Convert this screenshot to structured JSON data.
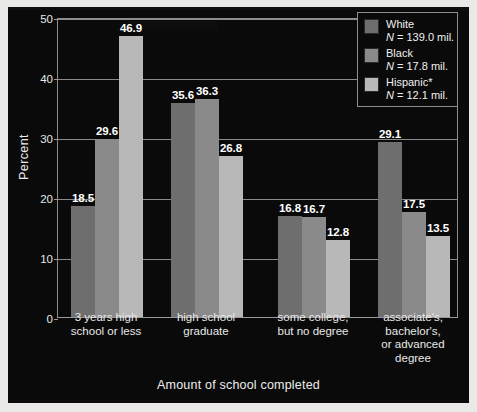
{
  "figure": {
    "background_color": "#0a0a0a",
    "page_color": "#e9e9e7"
  },
  "axis": {
    "ylabel": "Percent",
    "xlabel": "Amount of school completed",
    "yticks": [
      "0",
      "10",
      "20",
      "30",
      "40",
      "50"
    ]
  },
  "legend": {
    "entries": [
      {
        "label": "White",
        "sub": "N = 139.0 mil.",
        "n_symbol": "N",
        "n_value": " = 139.0 mil.",
        "color": "#6e6e6e"
      },
      {
        "label": "Black",
        "sub": "N = 17.8 mil.",
        "n_symbol": "N",
        "n_value": " = 17.8 mil.",
        "color": "#8a8a8a"
      },
      {
        "label": "Hispanic*",
        "sub": "N = 12.1 mil.",
        "n_symbol": "N",
        "n_value": " = 12.1 mil.",
        "color": "#b8b8b8"
      }
    ]
  },
  "chart_data": {
    "type": "bar",
    "title": "",
    "xlabel": "Amount of school completed",
    "ylabel": "Percent",
    "ylim": [
      0,
      50
    ],
    "ytick_step": 10,
    "grid": true,
    "legend_position": "top-right",
    "categories": [
      "3 years high\nschool or less",
      "high school\ngraduate",
      "some college,\nbut no degree",
      "associate's,\nbachelor's,\nor advanced\ndegree"
    ],
    "series": [
      {
        "name": "White",
        "legend_sub": "N = 139.0 mil.",
        "color": "#6e6e6e",
        "values": [
          18.5,
          35.6,
          16.8,
          29.1
        ]
      },
      {
        "name": "Black",
        "legend_sub": "N = 17.8 mil.",
        "color": "#8a8a8a",
        "values": [
          29.6,
          36.3,
          16.7,
          17.5
        ]
      },
      {
        "name": "Hispanic*",
        "legend_sub": "N = 12.1 mil.",
        "color": "#b8b8b8",
        "values": [
          46.9,
          26.8,
          12.8,
          13.5
        ]
      }
    ],
    "bar_labels": [
      [
        "18.5",
        "29.6",
        "46.9"
      ],
      [
        "35.6",
        "36.3",
        "26.8"
      ],
      [
        "16.8",
        "16.7",
        "12.8"
      ],
      [
        "29.1",
        "17.5",
        "13.5"
      ]
    ]
  }
}
